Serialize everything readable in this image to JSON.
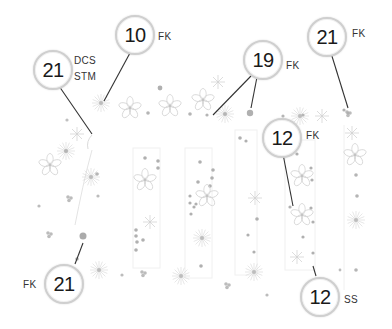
{
  "diagram": {
    "colors": {
      "line": "#333333",
      "circle_border": "#cfcfcf",
      "pattern": "#bdbdbd",
      "pattern_dot": "#a8a8a8"
    },
    "callouts": [
      {
        "id": "c1",
        "number": "21",
        "tags": [
          "DCS",
          "STM"
        ],
        "tag_side": "right"
      },
      {
        "id": "c2",
        "number": "10",
        "tags": [
          "FK"
        ],
        "tag_side": "right"
      },
      {
        "id": "c3",
        "number": "19",
        "tags": [
          "FK"
        ],
        "tag_side": "right"
      },
      {
        "id": "c4",
        "number": "21",
        "tags": [
          "FK"
        ],
        "tag_side": "right"
      },
      {
        "id": "c5",
        "number": "12",
        "tags": [
          "FK"
        ],
        "tag_side": "right"
      },
      {
        "id": "c6",
        "number": "21",
        "tags": [
          "FK"
        ],
        "tag_side": "left"
      },
      {
        "id": "c7",
        "number": "12",
        "tags": [
          "SS"
        ],
        "tag_side": "right"
      }
    ]
  }
}
